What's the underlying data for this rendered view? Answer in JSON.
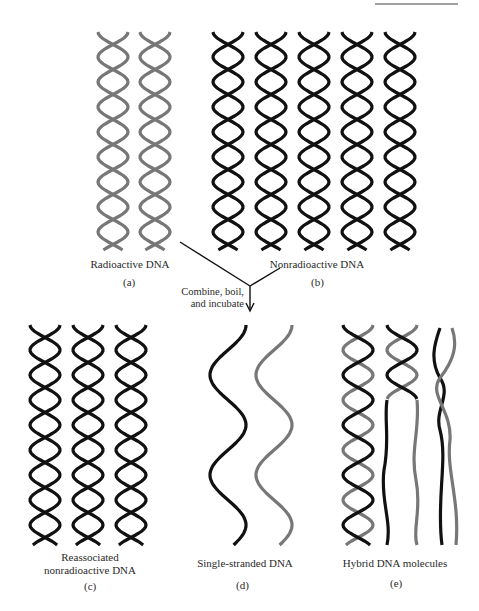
{
  "figure": {
    "type": "DNA reassociation / hybridization schematic",
    "colors": {
      "nonradioactive_strand": "#111111",
      "radioactive_strand": "#777777",
      "background": "#ffffff"
    },
    "panels": [
      {
        "id": "a",
        "label": "(a)",
        "caption": "Radioactive DNA",
        "molecules": 2,
        "strand_color": "gray",
        "form": "double helix"
      },
      {
        "id": "b",
        "label": "(b)",
        "caption": "Nonradioactive DNA",
        "molecules": 5,
        "strand_color": "black",
        "form": "double helix"
      },
      {
        "id": "c",
        "label": "(c)",
        "caption_line1": "Reassociated",
        "caption_line2": "nonradioactive DNA",
        "molecules": 3,
        "strand_color": "black",
        "form": "double helix"
      },
      {
        "id": "d",
        "label": "(d)",
        "caption": "Single-stranded DNA",
        "molecules": 2,
        "strand_color": "black and gray",
        "form": "single strand"
      },
      {
        "id": "e",
        "label": "(e)",
        "caption": "Hybrid DNA molecules",
        "molecules": 3,
        "strand_color": "black + gray",
        "form": "hybrid double helix"
      }
    ],
    "step": {
      "line1": "Combine, boil,",
      "line2": "and incubate",
      "arrow": "down-arrow"
    }
  }
}
